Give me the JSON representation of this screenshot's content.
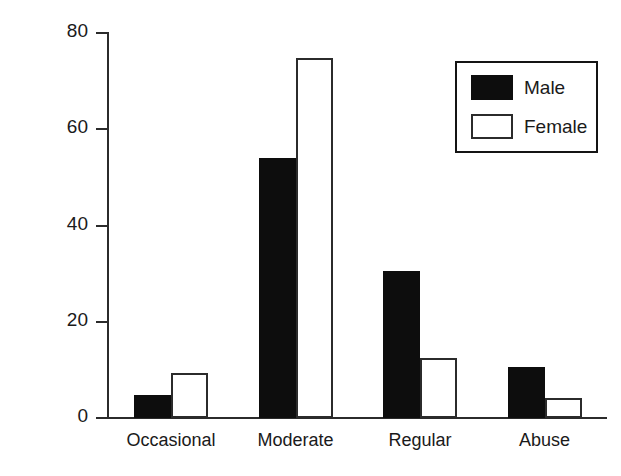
{
  "chart_data": {
    "type": "bar",
    "title": "",
    "subtitle": "",
    "xlabel": "",
    "ylabel": "Percentages",
    "categories": [
      "Occasional",
      "Moderate",
      "Regular",
      "Abuse"
    ],
    "series": [
      {
        "name": "Male",
        "values": [
          4.8,
          54.0,
          30.6,
          10.6
        ],
        "color": "#0d0d0d",
        "fill": "solid"
      },
      {
        "name": "Female",
        "values": [
          9.4,
          74.8,
          12.5,
          4.1
        ],
        "color": "#ffffff",
        "fill": "outline"
      }
    ],
    "ylim": [
      0,
      80
    ],
    "yticks": [
      0,
      20,
      40,
      60,
      80
    ],
    "ytick_labels": [
      "0",
      "20",
      "40",
      "60",
      "80"
    ],
    "grid": false,
    "legend_position": "top-right",
    "legend_entries": [
      "Male",
      "Female"
    ]
  },
  "axis": {
    "y_title": "Percentages"
  },
  "legend": {
    "items": [
      {
        "label": "Male"
      },
      {
        "label": "Female"
      }
    ]
  }
}
